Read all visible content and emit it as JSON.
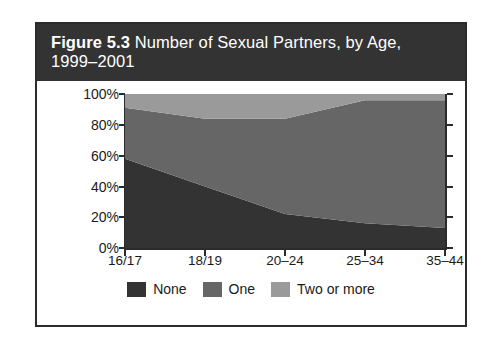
{
  "figure": {
    "label": "Figure 5.3",
    "caption": " Number of Sexual Partners, by Age, 1999–2001"
  },
  "colors": {
    "none": "#333333",
    "one": "#666666",
    "two_or_more": "#9a9a9a",
    "axis": "#2b2b2b",
    "banner_bg": "#333333",
    "banner_text": "#ffffff",
    "card_bg": "#ffffff"
  },
  "chart_data": {
    "type": "area",
    "title": "Figure 5.3 Number of Sexual Partners, by Age, 1999–2001",
    "xlabel": "",
    "ylabel": "",
    "stacked": true,
    "stack_total": 100,
    "grid": false,
    "legend_position": "bottom",
    "ylim": [
      0,
      100
    ],
    "yticks": [
      0,
      20,
      40,
      60,
      80,
      100
    ],
    "ytick_labels": [
      "0%",
      "20%",
      "40%",
      "60%",
      "80%",
      "100%"
    ],
    "categories": [
      "16/17",
      "18/19",
      "20–24",
      "25–34",
      "35–44"
    ],
    "series": [
      {
        "name": "None",
        "color": "#333333",
        "values": [
          58,
          40,
          22,
          16,
          13
        ]
      },
      {
        "name": "One",
        "color": "#666666",
        "values": [
          33,
          44,
          62,
          80,
          83
        ]
      },
      {
        "name": "Two or more",
        "color": "#9a9a9a",
        "values": [
          9,
          16,
          16,
          4,
          4
        ]
      }
    ]
  },
  "axis": {
    "y_ticks": [
      "100%",
      "80%",
      "60%",
      "40%",
      "20%",
      "0%"
    ],
    "x_ticks": [
      "16/17",
      "18/19",
      "20–24",
      "25–34",
      "35–44"
    ]
  },
  "legend": {
    "items": [
      {
        "label": "None"
      },
      {
        "label": "One"
      },
      {
        "label": "Two or more"
      }
    ]
  }
}
